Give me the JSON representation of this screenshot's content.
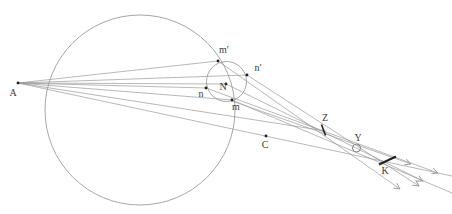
{
  "figure_title": "",
  "diagram": {
    "type": "geometry-optics-caustic",
    "canvas": {
      "width": 452,
      "height": 214
    },
    "colors": {
      "background": "#ffffff",
      "ray": "#9a9a9a",
      "circle": "#8f8f8f",
      "dark": "#1f1f1f",
      "label": "#3a3a3a"
    },
    "label_font_size": 10,
    "circles": [
      {
        "id": "large-sphere-circle",
        "cx": 140,
        "cy": 110,
        "r": 95
      },
      {
        "id": "wavefront-circle",
        "cx": 226.5,
        "cy": 81.5,
        "r": 20
      },
      {
        "id": "least-confusion-circle",
        "cx": 356.5,
        "cy": 148,
        "r": 4,
        "dark": true
      }
    ],
    "points": [
      {
        "id": "A",
        "label": "A",
        "x": 18,
        "y": 83,
        "dot": true,
        "label_x": 13,
        "label_y": 96
      },
      {
        "id": "m-prime",
        "label": "m′",
        "x": 218,
        "y": 61,
        "dot": true,
        "label_x": 224,
        "label_y": 53
      },
      {
        "id": "n-prime",
        "label": "n′",
        "x": 247,
        "y": 75,
        "dot": true,
        "label_x": 258,
        "label_y": 71
      },
      {
        "id": "n",
        "label": "n",
        "x": 206,
        "y": 88,
        "dot": true,
        "label_x": 201,
        "label_y": 97
      },
      {
        "id": "N",
        "label": "N",
        "x": 226,
        "y": 84,
        "dot": true,
        "label_x": 223,
        "label_y": 90
      },
      {
        "id": "m",
        "label": "m",
        "x": 232,
        "y": 100,
        "dot": true,
        "label_x": 236,
        "label_y": 110
      },
      {
        "id": "C",
        "label": "C",
        "x": 266,
        "y": 136,
        "dot": true,
        "label_x": 265,
        "label_y": 148
      },
      {
        "id": "Z",
        "label": "Z",
        "x": 324,
        "y": 130,
        "dot": false,
        "label_x": 325,
        "label_y": 121
      },
      {
        "id": "Y",
        "label": "Y",
        "x": 356,
        "y": 148,
        "dot": false,
        "label_x": 358,
        "label_y": 141
      },
      {
        "id": "K",
        "label": "K",
        "x": 387,
        "y": 161,
        "dot": false,
        "label_x": 385,
        "label_y": 174
      }
    ],
    "rays": [
      {
        "id": "ray-A-mprime",
        "x1": 18,
        "y1": 83,
        "x2": 218,
        "y2": 61,
        "arrow": false
      },
      {
        "id": "ray-A-nprime",
        "x1": 18,
        "y1": 83,
        "x2": 247,
        "y2": 75,
        "arrow": false
      },
      {
        "id": "ray-A-N",
        "x1": 18,
        "y1": 83,
        "x2": 226,
        "y2": 84,
        "arrow": false
      },
      {
        "id": "ray-A-n",
        "x1": 18,
        "y1": 83,
        "x2": 206,
        "y2": 88,
        "arrow": false
      },
      {
        "id": "ray-A-m",
        "x1": 18,
        "y1": 83,
        "x2": 232,
        "y2": 100,
        "arrow": false
      },
      {
        "id": "ray-A-Z",
        "x1": 18,
        "y1": 83,
        "x2": 326,
        "y2": 131,
        "arrow": false
      },
      {
        "id": "axis-A-C",
        "x1": 18,
        "y1": 83,
        "x2": 452,
        "y2": 176,
        "arrow": false
      },
      {
        "id": "refracted-mprime",
        "x1": 218,
        "y1": 61,
        "x2": 400,
        "y2": 189,
        "arrow": true
      },
      {
        "id": "refracted-nprime",
        "x1": 247,
        "y1": 75,
        "x2": 419,
        "y2": 186,
        "arrow": true
      },
      {
        "id": "refracted-N",
        "x1": 226,
        "y1": 84,
        "x2": 423,
        "y2": 181,
        "arrow": true
      },
      {
        "id": "refracted-n",
        "x1": 206,
        "y1": 88,
        "x2": 438,
        "y2": 173,
        "arrow": true
      },
      {
        "id": "refracted-m-long",
        "x1": 232,
        "y1": 100,
        "x2": 452,
        "y2": 193,
        "arrow": false
      },
      {
        "id": "refracted-m-through-Y",
        "x1": 232,
        "y1": 101,
        "x2": 411,
        "y2": 164,
        "arrow": true
      }
    ],
    "ticks": [
      {
        "id": "focal-tick-Z",
        "x1": 321.5,
        "y1": 124.5,
        "x2": 325.5,
        "y2": 135.5,
        "width": 1.6
      },
      {
        "id": "focal-tick-K",
        "x1": 379,
        "y1": 164.5,
        "x2": 396,
        "y2": 156.5,
        "width": 2.2
      }
    ],
    "dot_radius": 1.4
  }
}
